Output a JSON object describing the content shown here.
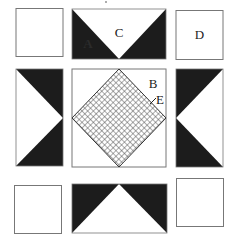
{
  "diagram": {
    "type": "quilt-block",
    "grid": "3x3",
    "colors": {
      "dark": "#1c1c1c",
      "light": "#ffffff",
      "border": "#777777",
      "hatch": "#555555"
    },
    "pieces": [
      {
        "id": "top-left",
        "shape": "square",
        "fill": "plain"
      },
      {
        "id": "top-middle",
        "shape": "rectangle",
        "fill": "dark-corners-white-inverted-triangle",
        "label": "C",
        "inner_label": "A"
      },
      {
        "id": "top-right",
        "shape": "square",
        "fill": "plain",
        "label": "D"
      },
      {
        "id": "middle-left",
        "shape": "rectangle",
        "fill": "dark-corners-white-triangle-pointing-right"
      },
      {
        "id": "center",
        "shape": "square",
        "fill": "hatched-diamond",
        "labels": [
          "B",
          "E"
        ]
      },
      {
        "id": "middle-right",
        "shape": "rectangle",
        "fill": "dark-corners-white-triangle-pointing-left"
      },
      {
        "id": "bottom-left",
        "shape": "square",
        "fill": "plain"
      },
      {
        "id": "bottom-middle",
        "shape": "rectangle",
        "fill": "dark-corners-white-triangle-pointing-up"
      },
      {
        "id": "bottom-right",
        "shape": "square",
        "fill": "plain"
      }
    ],
    "labels": {
      "A": "A",
      "B": "B",
      "C": "C",
      "D": "D",
      "E": "E"
    }
  }
}
